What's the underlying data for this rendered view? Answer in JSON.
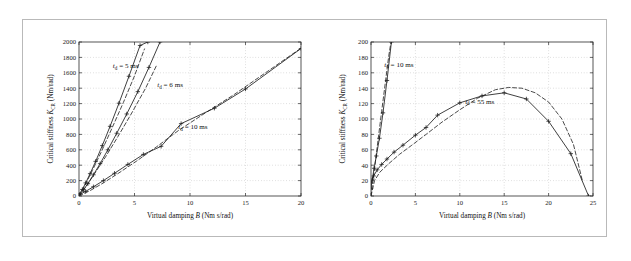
{
  "figure": {
    "border_color": "#b9b9b9",
    "background": "#ffffff"
  },
  "chart_data": [
    {
      "id": "left",
      "type": "line",
      "title": "",
      "xlabel": "Virtual damping B (Nm s/rad)",
      "ylabel": "Critical stiffness K_CR (Nm/rad)",
      "xlabel_parts": {
        "pre": "Virtual damping ",
        "italic": "B",
        "post": " (Nm s/rad)"
      },
      "ylabel_parts": {
        "pre": "Critical stiffness ",
        "italic": "K",
        "sub": "CR",
        "post": " (Nm/rad)"
      },
      "xlim": [
        0,
        20
      ],
      "ylim": [
        0,
        2000
      ],
      "xticks": [
        0,
        5,
        10,
        15,
        20
      ],
      "yticks": [
        0,
        200,
        400,
        600,
        800,
        1000,
        1200,
        1400,
        1600,
        1800,
        2000
      ],
      "grid": true,
      "legend_position": "inline-annotations",
      "annotations": [
        {
          "text": "t_d = 5 ms",
          "display": "t",
          "sub": "d",
          "rest": " = 5 ms",
          "x": 3.05,
          "y": 1660
        },
        {
          "text": "t_d = 6 ms",
          "display": "t",
          "sub": "d",
          "rest": " = 6 ms",
          "x": 7.05,
          "y": 1415
        },
        {
          "text": "t_d = 10 ms",
          "display": "t",
          "sub": "d",
          "rest": " = 10 ms",
          "x": 8.95,
          "y": 870
        }
      ],
      "series": [
        {
          "name": "t_d = 5 ms (simulated)",
          "style": "solid",
          "markers": "plus",
          "x": [
            0,
            0.3,
            0.6,
            1.0,
            1.5,
            2.1,
            2.8,
            3.6,
            4.5,
            5.5,
            6.2
          ],
          "y": [
            20,
            85,
            170,
            290,
            450,
            655,
            905,
            1205,
            1555,
            1955,
            2000
          ]
        },
        {
          "name": "t_d = 5 ms (theoretical)",
          "style": "dashed",
          "markers": "none",
          "x": [
            0,
            0.5,
            1.2,
            2.0,
            3.0,
            4.0,
            5.0,
            5.9
          ],
          "y": [
            0,
            130,
            330,
            570,
            890,
            1215,
            1560,
            1910
          ]
        },
        {
          "name": "t_d = 6 ms (simulated)",
          "style": "solid",
          "markers": "plus",
          "x": [
            0,
            0.4,
            0.8,
            1.3,
            1.9,
            2.6,
            3.4,
            4.3,
            5.3,
            6.3,
            7.3
          ],
          "y": [
            18,
            80,
            160,
            275,
            420,
            600,
            815,
            1065,
            1355,
            1670,
            2000
          ]
        },
        {
          "name": "t_d = 6 ms (theoretical)",
          "style": "dashed",
          "markers": "none",
          "x": [
            0,
            0.6,
            1.4,
            2.4,
            3.5,
            4.7,
            6.0,
            7.0
          ],
          "y": [
            0,
            115,
            290,
            510,
            770,
            1065,
            1400,
            1700
          ]
        },
        {
          "name": "t_d = 10 ms (simulated)",
          "style": "solid",
          "markers": "plus",
          "x": [
            0,
            0.6,
            1.3,
            2.2,
            3.2,
            4.4,
            5.8,
            7.4,
            9.2,
            12.2,
            15.0,
            20.0
          ],
          "y": [
            15,
            60,
            120,
            200,
            295,
            410,
            540,
            645,
            940,
            1140,
            1390,
            1915
          ]
        },
        {
          "name": "t_d = 10 ms (theoretical)",
          "style": "dashed",
          "markers": "none",
          "x": [
            0,
            1.0,
            2.2,
            3.6,
            5.2,
            7.0,
            9.0,
            11.5,
            14.0,
            17.0,
            20.0
          ],
          "y": [
            0,
            70,
            170,
            300,
            455,
            640,
            855,
            1090,
            1320,
            1620,
            1920
          ]
        }
      ]
    },
    {
      "id": "right",
      "type": "line",
      "title": "",
      "xlabel": "Virtual damping B (Nm s/rad)",
      "ylabel": "Critical stiffness K_CR (Nm/rad)",
      "xlabel_parts": {
        "pre": "Virtual damping ",
        "italic": "B",
        "post": " (Nm s/rad)"
      },
      "ylabel_parts": {
        "pre": "Critical stiffness ",
        "italic": "K",
        "sub": "CR",
        "post": " (Nm/rad)"
      },
      "xlim": [
        0,
        25
      ],
      "ylim": [
        0,
        200
      ],
      "xticks": [
        0,
        5,
        10,
        15,
        20,
        25
      ],
      "yticks": [
        0,
        20,
        40,
        60,
        80,
        100,
        120,
        140,
        160,
        180,
        200
      ],
      "grid": true,
      "legend_position": "inline-annotations",
      "annotations": [
        {
          "text": "t_d = 10 ms",
          "display": "t",
          "sub": "d",
          "rest": " = 10 ms",
          "x": 1.5,
          "y": 168
        },
        {
          "text": "t_d = 55 ms",
          "display": "t",
          "sub": "d",
          "rest": " = 55 ms",
          "x": 10.6,
          "y": 120
        }
      ],
      "series": [
        {
          "name": "t_d = 10 ms (simulated)",
          "style": "solid",
          "markers": "plus",
          "x": [
            0,
            0.15,
            0.35,
            0.6,
            0.95,
            1.35,
            1.8,
            2.3
          ],
          "y": [
            10,
            22,
            36,
            52,
            75,
            108,
            150,
            200
          ]
        },
        {
          "name": "t_d = 10 ms (theoretical)",
          "style": "dashed",
          "markers": "none",
          "x": [
            0,
            0.2,
            0.5,
            0.85,
            1.2,
            1.6,
            2.0,
            2.25
          ],
          "y": [
            0,
            18,
            45,
            78,
            110,
            146,
            182,
            200
          ]
        },
        {
          "name": "t_d = 55 ms (simulated)",
          "style": "solid",
          "markers": "plus",
          "x": [
            0,
            0.3,
            0.7,
            1.2,
            1.8,
            2.6,
            3.6,
            5.0,
            6.2,
            7.5,
            10.0,
            12.5,
            15.0,
            17.5,
            20.0,
            22.5,
            24.5
          ],
          "y": [
            17,
            26,
            34,
            41,
            48,
            57,
            66,
            79,
            89,
            105,
            121,
            130,
            134,
            126,
            97,
            55,
            0
          ]
        },
        {
          "name": "t_d = 55 ms (theoretical)",
          "style": "dashed",
          "markers": "none",
          "x": [
            0,
            0.4,
            1.0,
            2.0,
            3.2,
            4.6,
            6.2,
            8.0,
            10.0,
            12.0,
            14.0,
            15.5,
            17.0,
            18.5,
            20.0,
            21.5,
            22.8,
            23.8
          ],
          "y": [
            0,
            20,
            31,
            42,
            54,
            66,
            80,
            96,
            112,
            127,
            138,
            141,
            140,
            134,
            122,
            100,
            67,
            20
          ]
        }
      ]
    }
  ]
}
